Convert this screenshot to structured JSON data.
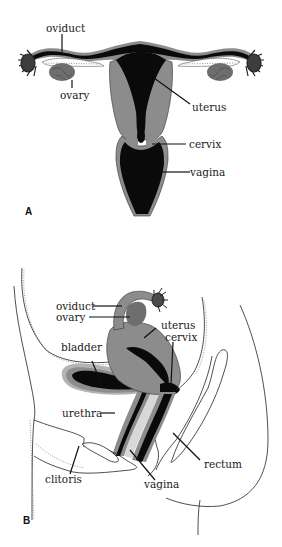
{
  "figure": {
    "panels": [
      {
        "id": "A",
        "label": "A",
        "view": "frontal",
        "structures": [
          {
            "key": "oviduct",
            "label": "oviduct"
          },
          {
            "key": "ovary",
            "label": "ovary"
          },
          {
            "key": "uterus",
            "label": "uterus"
          },
          {
            "key": "cervix",
            "label": "cervix"
          },
          {
            "key": "vagina",
            "label": "vagina"
          }
        ]
      },
      {
        "id": "B",
        "label": "B",
        "view": "sagittal",
        "structures": [
          {
            "key": "oviduct",
            "label": "oviduct"
          },
          {
            "key": "ovary",
            "label": "ovary"
          },
          {
            "key": "uterus",
            "label": "uterus"
          },
          {
            "key": "cervix",
            "label": "cervix"
          },
          {
            "key": "bladder",
            "label": "bladder"
          },
          {
            "key": "urethra",
            "label": "urethra"
          },
          {
            "key": "clitoris",
            "label": "clitoris"
          },
          {
            "key": "vagina",
            "label": "vagina"
          },
          {
            "key": "rectum",
            "label": "rectum"
          }
        ]
      }
    ],
    "colors": {
      "lumen": "#0a0a0a",
      "tissue": "#8c8c8c",
      "ovary": "#6e6e6e",
      "wall_light": "#b4b4b4",
      "line": "#222222",
      "background": "#ffffff"
    }
  }
}
